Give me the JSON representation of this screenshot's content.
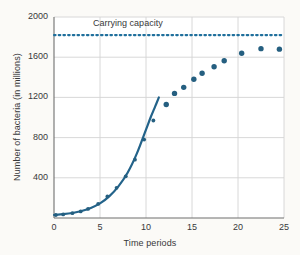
{
  "chart_data": {
    "type": "scatter",
    "title": "",
    "xlabel": "Time periods",
    "ylabel": "Number of bacteria (in millions)",
    "xlim": [
      0,
      25
    ],
    "ylim": [
      0,
      2000
    ],
    "xticks": [
      0,
      5,
      10,
      15,
      20,
      25
    ],
    "yticks": [
      400,
      800,
      1200,
      1600,
      2000
    ],
    "grid": true,
    "legend": "none",
    "annotations": [
      {
        "text": "Carrying capacity",
        "x": 8.6,
        "y": 1935,
        "kind": "line-label"
      }
    ],
    "series": [
      {
        "name": "Exponential growth model",
        "kind": "line",
        "style": "solid",
        "color": "#23638a",
        "x": [
          0.0,
          1.0,
          2.0,
          3.0,
          4.0,
          5.0,
          6.0,
          7.0,
          8.0,
          9.0,
          10.0,
          10.5,
          11.0,
          11.4
        ],
        "y": [
          30,
          38,
          50,
          70,
          100,
          145,
          215,
          315,
          450,
          640,
          880,
          1000,
          1110,
          1200
        ]
      },
      {
        "name": "Carrying capacity",
        "kind": "line",
        "style": "dotted",
        "color": "#1f6f9c",
        "x": [
          0,
          25
        ],
        "y": [
          1820,
          1820
        ]
      },
      {
        "name": "Observed bacteria counts",
        "kind": "scatter",
        "color": "#255f80",
        "points": [
          {
            "x": 0.2,
            "y": 30
          },
          {
            "x": 1.0,
            "y": 36
          },
          {
            "x": 2.0,
            "y": 48
          },
          {
            "x": 2.9,
            "y": 65
          },
          {
            "x": 3.7,
            "y": 90
          },
          {
            "x": 4.8,
            "y": 140
          },
          {
            "x": 5.8,
            "y": 215
          },
          {
            "x": 6.8,
            "y": 300
          },
          {
            "x": 7.8,
            "y": 415
          },
          {
            "x": 8.8,
            "y": 580
          },
          {
            "x": 9.8,
            "y": 780
          },
          {
            "x": 10.8,
            "y": 970
          },
          {
            "x": 12.2,
            "y": 1130
          },
          {
            "x": 13.1,
            "y": 1240
          },
          {
            "x": 14.1,
            "y": 1300
          },
          {
            "x": 15.2,
            "y": 1380
          },
          {
            "x": 16.1,
            "y": 1440
          },
          {
            "x": 17.4,
            "y": 1505
          },
          {
            "x": 18.5,
            "y": 1565
          },
          {
            "x": 20.4,
            "y": 1640
          },
          {
            "x": 22.5,
            "y": 1685
          },
          {
            "x": 24.5,
            "y": 1680
          }
        ]
      }
    ]
  },
  "colors": {
    "accent": "#23638a",
    "scatter": "#255f80",
    "capacity_line": "#1f6f9c",
    "grid": "#d4d4d4",
    "axis": "#7a7a7a",
    "text": "#38383a",
    "background": "#fbfaf7",
    "plot_background": "#ffffff"
  }
}
